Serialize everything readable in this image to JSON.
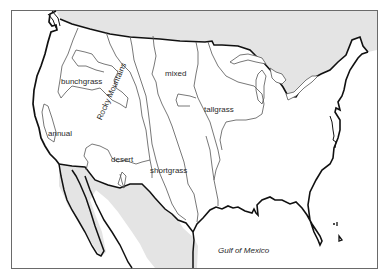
{
  "map": {
    "type": "grassland vegetation regions of the continental United States",
    "regions": [
      {
        "id": "bunchgrass",
        "label": "bunchgrass"
      },
      {
        "id": "annual",
        "label": "annual"
      },
      {
        "id": "desert",
        "label": "desert"
      },
      {
        "id": "mixed",
        "label": "mixed"
      },
      {
        "id": "shortgrass",
        "label": "shortgrass"
      },
      {
        "id": "tallgrass",
        "label": "tallgrass"
      }
    ],
    "features": {
      "mountains": "Rocky Mountains",
      "water_body": "Gulf of Mexico"
    },
    "colors": {
      "land": "#ffffff",
      "foreign_land": "#e6e6e6",
      "coastline": "#111111",
      "region_boundary": "#555555",
      "frame": "#666666"
    }
  }
}
